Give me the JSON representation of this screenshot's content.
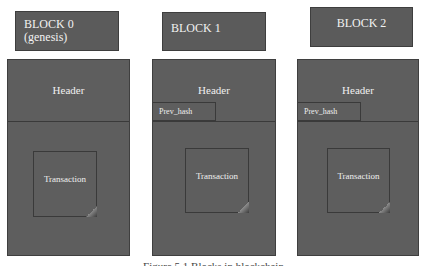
{
  "diagram": {
    "blocks": [
      {
        "label_line1": "BLOCK 0",
        "label_line2": "(genesis)",
        "header": "Header",
        "prev_hash": null,
        "transaction": "Transaction"
      },
      {
        "label_line1": "BLOCK 1",
        "label_line2": "",
        "header": "Header",
        "prev_hash": "Prev_hash",
        "transaction": "Transaction"
      },
      {
        "label_line1": "BLOCK 2",
        "label_line2": "",
        "header": "Header",
        "prev_hash": "Prev_hash",
        "transaction": "Transaction"
      }
    ],
    "caption": "Figure 5.1 Blocks in blockchain"
  },
  "colors": {
    "block_fill": "#5e5e5e",
    "border": "#3f3f3f",
    "text": "#f0f0f0",
    "background": "#ffffff"
  }
}
